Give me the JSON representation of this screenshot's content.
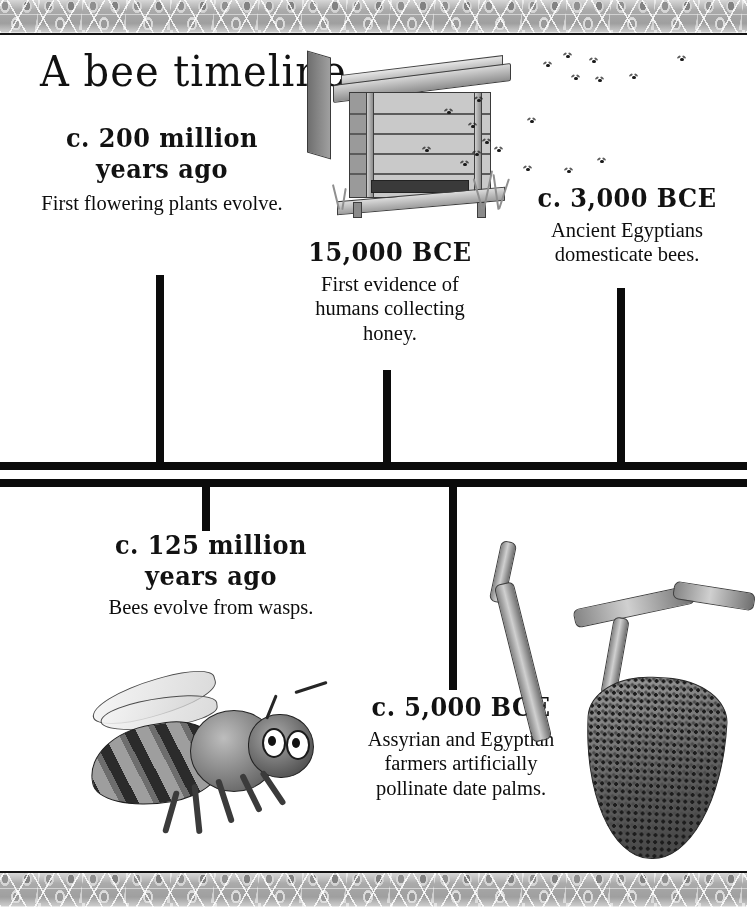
{
  "poster": {
    "title": "A bee timeline",
    "border_pattern": "honeycomb",
    "background_color": "#ffffff",
    "line_color": "#0b0b0b"
  },
  "timeline": {
    "upper_entries": [
      {
        "id": "e1",
        "date": "c. 200 million\nyears ago",
        "date_line1": "c. 200 million",
        "date_line2": "years ago",
        "description": "First flowering plants evolve.",
        "tick_x": 156,
        "tick_top": 275,
        "tick_height": 190
      },
      {
        "id": "e2",
        "date": "15,000 BCE",
        "date_line1": "15,000 BCE",
        "date_line2": "",
        "description": "First evidence of humans collecting honey.",
        "tick_x": 383,
        "tick_top": 370,
        "tick_height": 95
      },
      {
        "id": "e3",
        "date": "c. 3,000 BCE",
        "date_line1": "c. 3,000 BCE",
        "date_line2": "",
        "description": "Ancient Egyptians domesticate bees.",
        "tick_x": 617,
        "tick_top": 288,
        "tick_height": 177
      }
    ],
    "lower_entries": [
      {
        "id": "e4",
        "date": "c. 125 million\nyears ago",
        "date_line1": "c. 125 million",
        "date_line2": "years ago",
        "description": "Bees evolve from wasps.",
        "tick_x": 206,
        "tick_top": 485,
        "tick_height": 46
      },
      {
        "id": "e5",
        "date": "c. 5,000 BCE",
        "date_line1": "c. 5,000 BCE",
        "date_line2": "",
        "description": "Assyrian and Egyptian farmers artificially pollinate date palms.",
        "tick_x": 453,
        "tick_top": 485,
        "tick_height": 205
      }
    ]
  },
  "illustrations": [
    {
      "name": "beehive-illustration",
      "caption": "wooden beehive box with bees"
    },
    {
      "name": "bee-illustration",
      "caption": "honey bee"
    },
    {
      "name": "swarm-branch-illustration",
      "caption": "bee swarm hanging from tree branch"
    }
  ]
}
